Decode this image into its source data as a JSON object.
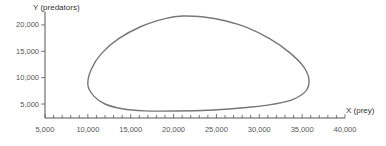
{
  "chart_data": {
    "type": "line",
    "title": "",
    "xlabel": "X (prey)",
    "ylabel": "Y (predators)",
    "xlim": [
      5000,
      40000
    ],
    "ylim": [
      2300,
      22000
    ],
    "x_ticks": [
      5000,
      10000,
      15000,
      20000,
      25000,
      30000,
      35000,
      40000
    ],
    "x_tick_labels": [
      "5,000",
      "10,000",
      "15,000",
      "20,000",
      "25,000",
      "30,000",
      "35,000",
      "40,000"
    ],
    "x_minor_step": 1000,
    "y_ticks": [
      5000,
      10000,
      15000,
      20000
    ],
    "y_tick_labels": [
      "5,000",
      "10,000",
      "15,000",
      "20,000"
    ],
    "grid": false,
    "legend": null,
    "series": [
      {
        "name": "predator-prey phase cycle",
        "closed": true,
        "color": "#777777",
        "x": [
          10000,
          10400,
          11600,
          13600,
          16200,
          19000,
          21100,
          23500,
          26000,
          28600,
          31200,
          33500,
          35200,
          35800,
          35400,
          33800,
          31000,
          27500,
          24000,
          20200,
          16600,
          14000,
          12000,
          10700,
          10000
        ],
        "y": [
          8600,
          11600,
          14600,
          17400,
          19700,
          21200,
          21700,
          21500,
          20800,
          19500,
          17400,
          14800,
          12000,
          9550,
          7400,
          5800,
          4800,
          4200,
          3800,
          3670,
          3700,
          4100,
          5000,
          6500,
          8600
        ]
      }
    ]
  }
}
